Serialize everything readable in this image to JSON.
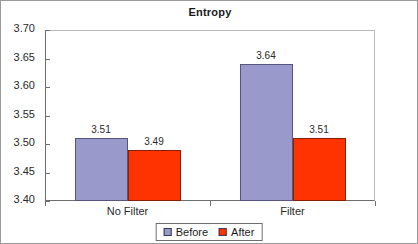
{
  "chart_data": {
    "type": "bar",
    "title": "Entropy",
    "xlabel": "",
    "ylabel": "",
    "categories": [
      "No Filter",
      "Filter"
    ],
    "series": [
      {
        "name": "Before",
        "values": [
          3.51,
          3.64
        ],
        "color": "#9999cc"
      },
      {
        "name": "After",
        "values": [
          3.49,
          3.51
        ],
        "color": "#ff3300"
      }
    ],
    "data_labels": [
      [
        "3.51",
        "3.49"
      ],
      [
        "3.64",
        "3.51"
      ]
    ],
    "ylim": [
      3.4,
      3.7
    ],
    "ytick_labels": [
      "3.70",
      "3.65",
      "3.60",
      "3.55",
      "3.50",
      "3.45",
      "3.40"
    ],
    "ytick_values": [
      3.7,
      3.65,
      3.6,
      3.55,
      3.5,
      3.45,
      3.4
    ],
    "grid": false,
    "legend_position": "bottom"
  },
  "legend": {
    "entries": [
      {
        "label": "Before",
        "color": "#9999cc"
      },
      {
        "label": "After",
        "color": "#ff3300"
      }
    ]
  }
}
